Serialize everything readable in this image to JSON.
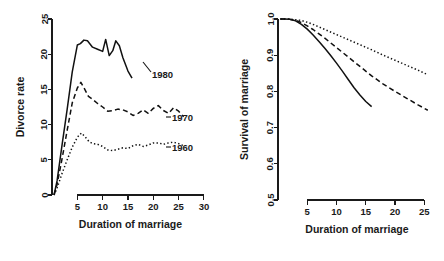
{
  "figure": {
    "type": "two-panel-line-chart",
    "background": "#ffffff",
    "ink_color": "#111111"
  },
  "chart_data": [
    {
      "type": "line",
      "panel": "left",
      "title": "",
      "xlabel": "Duration of marriage",
      "ylabel": "Divorce rate",
      "xlim": [
        0,
        31
      ],
      "ylim": [
        0,
        25
      ],
      "xticks": [
        5,
        10,
        15,
        20,
        25,
        30
      ],
      "yticks": [
        0,
        5,
        10,
        15,
        20,
        25
      ],
      "grid": false,
      "legend": "inline-end-labels",
      "series": [
        {
          "name": "1980",
          "style": "solid",
          "label": "1980",
          "x": [
            0.4,
            1,
            2,
            3,
            4,
            5,
            5.6,
            6.3,
            7,
            8,
            9,
            10,
            10.6,
            11.3,
            12,
            12.6,
            13.3,
            14,
            15,
            15.8
          ],
          "y": [
            0.0,
            2.0,
            7.2,
            12.2,
            17.5,
            21.3,
            21.5,
            22.0,
            21.9,
            21.0,
            20.7,
            20.4,
            22.1,
            19.8,
            20.5,
            21.9,
            21.2,
            19.5,
            17.6,
            16.6
          ]
        },
        {
          "name": "1970",
          "style": "dashed",
          "label": "1970",
          "x": [
            0.4,
            1,
            2,
            3,
            4,
            5,
            5.7,
            6.4,
            7.2,
            8,
            9,
            10,
            11,
            12,
            13,
            14,
            15,
            16,
            17,
            18,
            19,
            20,
            21,
            22,
            23,
            24,
            25,
            26
          ],
          "y": [
            0.0,
            1.5,
            5.2,
            9.2,
            13.1,
            15.2,
            16.0,
            15.1,
            14.0,
            13.6,
            13.0,
            12.5,
            11.9,
            12.0,
            12.2,
            12.1,
            11.8,
            11.3,
            11.6,
            12.1,
            11.6,
            12.3,
            12.7,
            12.0,
            11.6,
            12.4,
            11.9,
            11.1
          ]
        },
        {
          "name": "1960",
          "style": "dotted",
          "label": "1960",
          "x": [
            0.4,
            1,
            2,
            3,
            4,
            5,
            5.8,
            6.5,
            7.3,
            8,
            9,
            10,
            11,
            12,
            13,
            14,
            15,
            16,
            17,
            18,
            19,
            20,
            21,
            22,
            23,
            24,
            25,
            26
          ],
          "y": [
            0.0,
            1.0,
            3.1,
            5.0,
            6.8,
            8.2,
            8.8,
            8.3,
            7.6,
            7.3,
            7.2,
            6.9,
            6.4,
            6.3,
            6.5,
            6.7,
            6.6,
            7.0,
            7.2,
            6.9,
            7.1,
            7.4,
            7.4,
            7.2,
            7.4,
            7.5,
            7.3,
            7.0
          ]
        }
      ]
    },
    {
      "type": "line",
      "panel": "right",
      "title": "",
      "xlabel": "Duration of marriage",
      "ylabel": "Survival of marriage",
      "xlim": [
        0,
        27
      ],
      "ylim": [
        0.5,
        1.0
      ],
      "xticks": [
        5,
        10,
        15,
        20,
        25
      ],
      "yticks": [
        0.5,
        0.6,
        0.7,
        0.8,
        0.9,
        1.0
      ],
      "grid": false,
      "legend": "none",
      "series": [
        {
          "name": "1980",
          "style": "solid",
          "x": [
            0.4,
            1,
            2,
            3,
            4,
            5,
            6,
            7,
            8,
            9,
            10,
            11,
            12,
            13,
            14,
            15,
            16
          ],
          "y": [
            1.0,
            1.0,
            0.999,
            0.995,
            0.985,
            0.972,
            0.956,
            0.938,
            0.919,
            0.899,
            0.878,
            0.856,
            0.833,
            0.81,
            0.79,
            0.772,
            0.758
          ]
        },
        {
          "name": "1970",
          "style": "dashed",
          "x": [
            0.4,
            1,
            2,
            3,
            4,
            5,
            6,
            7,
            8,
            9,
            10,
            12,
            14,
            16,
            18,
            20,
            22,
            24,
            25.6
          ],
          "y": [
            1.0,
            1.0,
            0.999,
            0.996,
            0.99,
            0.981,
            0.971,
            0.959,
            0.947,
            0.934,
            0.921,
            0.895,
            0.869,
            0.843,
            0.82,
            0.8,
            0.781,
            0.762,
            0.748
          ]
        },
        {
          "name": "1960",
          "style": "dotted",
          "x": [
            0.4,
            1,
            2,
            3,
            4,
            5,
            6,
            7,
            8,
            10,
            12,
            14,
            16,
            18,
            20,
            22,
            24,
            25.6
          ],
          "y": [
            1.0,
            1.0,
            1.0,
            0.998,
            0.996,
            0.991,
            0.985,
            0.978,
            0.971,
            0.957,
            0.943,
            0.929,
            0.915,
            0.9,
            0.886,
            0.872,
            0.858,
            0.846
          ]
        }
      ]
    }
  ],
  "left_panel": {
    "y_axis_title": "Divorce rate",
    "x_axis_title": "Duration of marriage",
    "y_tick_labels": [
      "0",
      "5",
      "10",
      "15",
      "20",
      "25"
    ],
    "x_tick_labels": [
      "5",
      "10",
      "15",
      "20",
      "25",
      "30"
    ],
    "series_labels": [
      "1980",
      "1970",
      "1960"
    ]
  },
  "right_panel": {
    "y_axis_title": "Survival of marriage",
    "x_axis_title": "Duration of marriage",
    "y_tick_labels": [
      "0.5",
      "0.6",
      "0.7",
      "0.8",
      "0.9",
      "1.0"
    ],
    "x_tick_labels": [
      "5",
      "10",
      "15",
      "20",
      "25"
    ]
  }
}
